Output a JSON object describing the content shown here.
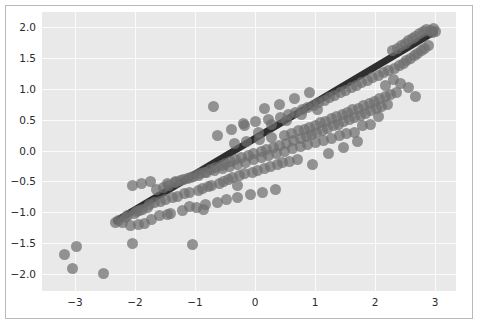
{
  "chart_data": {
    "type": "scatter",
    "title": "",
    "subtitle": "",
    "xlabel": "",
    "ylabel": "",
    "xlim": [
      -3.55,
      3.35
    ],
    "ylim": [
      -2.28,
      2.25
    ],
    "xticks": [
      -3,
      -2,
      -1,
      0,
      1,
      2,
      3
    ],
    "xticklabels": [
      "−3",
      "−2",
      "−1",
      "0",
      "1",
      "2",
      "3"
    ],
    "yticks": [
      -2.0,
      -1.5,
      -1.0,
      -0.5,
      0.0,
      0.5,
      1.0,
      1.5,
      2.0
    ],
    "yticklabels": [
      "−2.0",
      "−1.5",
      "−1.0",
      "−0.5",
      "0.0",
      "0.5",
      "1.0",
      "1.5",
      "2.0"
    ],
    "grid": true,
    "grid_color": "#fbfbfb",
    "plot_background": "#e9e9e9",
    "figure_background": "#ffffff",
    "legend": null,
    "marker": {
      "shape": "circle",
      "size_px": 11,
      "color": "#6f6f6f",
      "alpha": 0.72
    },
    "series": [
      {
        "name": "observations",
        "type": "scatter",
        "points": [
          [
            -3.18,
            -1.68
          ],
          [
            -3.05,
            -1.92
          ],
          [
            -2.97,
            -1.55
          ],
          [
            -2.52,
            -1.99
          ],
          [
            -2.33,
            -1.16
          ],
          [
            -2.27,
            -1.13
          ],
          [
            -2.21,
            -1.16
          ],
          [
            -2.16,
            -1.09
          ],
          [
            -2.12,
            -1.05
          ],
          [
            -2.08,
            -1.21
          ],
          [
            -2.04,
            -1.51
          ],
          [
            -2.01,
            -1.02
          ],
          [
            -1.98,
            -0.99
          ],
          [
            -1.95,
            -1.2
          ],
          [
            -1.92,
            -0.97
          ],
          [
            -1.88,
            -0.95
          ],
          [
            -1.84,
            -1.18
          ],
          [
            -1.8,
            -0.92
          ],
          [
            -1.76,
            -0.88
          ],
          [
            -1.72,
            -1.12
          ],
          [
            -1.68,
            -0.85
          ],
          [
            -1.64,
            -0.63
          ],
          [
            -1.6,
            -1.06
          ],
          [
            -1.57,
            -0.82
          ],
          [
            -1.53,
            -0.6
          ],
          [
            -1.49,
            -0.79
          ],
          [
            -1.45,
            -0.56
          ],
          [
            -1.41,
            -1.02
          ],
          [
            -1.37,
            -0.76
          ],
          [
            -1.33,
            -0.52
          ],
          [
            -1.29,
            -0.74
          ],
          [
            -1.25,
            -0.49
          ],
          [
            -1.21,
            -0.97
          ],
          [
            -1.17,
            -0.7
          ],
          [
            -1.13,
            -0.45
          ],
          [
            -1.09,
            -0.68
          ],
          [
            -1.05,
            -1.52
          ],
          [
            -1.02,
            -0.42
          ],
          [
            -0.98,
            -0.92
          ],
          [
            -0.95,
            -0.65
          ],
          [
            -0.92,
            -0.38
          ],
          [
            -0.88,
            -0.62
          ],
          [
            -0.85,
            -0.35
          ],
          [
            -0.82,
            -0.88
          ],
          [
            -0.78,
            -0.59
          ],
          [
            -0.75,
            -0.31
          ],
          [
            -0.72,
            -0.56
          ],
          [
            -0.69,
            0.72
          ],
          [
            -0.66,
            -0.28
          ],
          [
            -0.62,
            -0.84
          ],
          [
            -0.59,
            -0.53
          ],
          [
            -0.56,
            -0.24
          ],
          [
            -0.53,
            -0.5
          ],
          [
            -0.5,
            -0.21
          ],
          [
            -0.47,
            -0.8
          ],
          [
            -0.44,
            -0.47
          ],
          [
            -0.41,
            -0.18
          ],
          [
            -0.38,
            -0.44
          ],
          [
            -0.35,
            0.12
          ],
          [
            -0.32,
            -0.14
          ],
          [
            -0.29,
            -0.76
          ],
          [
            -0.26,
            -0.41
          ],
          [
            -0.23,
            -0.11
          ],
          [
            -0.2,
            0.44
          ],
          [
            -0.17,
            -0.38
          ],
          [
            -0.14,
            0.15
          ],
          [
            -0.11,
            -0.08
          ],
          [
            -0.08,
            -0.72
          ],
          [
            -0.05,
            -0.35
          ],
          [
            -0.02,
            -0.04
          ],
          [
            0.01,
            0.47
          ],
          [
            0.04,
            -0.32
          ],
          [
            0.07,
            0.18
          ],
          [
            0.1,
            -0.01
          ],
          [
            0.13,
            -0.68
          ],
          [
            0.16,
            -0.29
          ],
          [
            0.19,
            0.02
          ],
          [
            0.22,
            0.5
          ],
          [
            0.25,
            -0.26
          ],
          [
            0.28,
            0.21
          ],
          [
            0.31,
            0.05
          ],
          [
            0.34,
            -0.64
          ],
          [
            0.37,
            -0.23
          ],
          [
            0.4,
            0.09
          ],
          [
            0.43,
            0.54
          ],
          [
            0.46,
            -0.2
          ],
          [
            0.49,
            0.25
          ],
          [
            0.52,
            0.12
          ],
          [
            0.55,
            0.58
          ],
          [
            0.58,
            -0.17
          ],
          [
            0.61,
            0.28
          ],
          [
            0.64,
            0.16
          ],
          [
            0.67,
            0.62
          ],
          [
            0.7,
            -0.14
          ],
          [
            0.73,
            0.32
          ],
          [
            0.76,
            0.19
          ],
          [
            0.79,
            0.66
          ],
          [
            0.82,
            0.35
          ],
          [
            0.85,
            0.23
          ],
          [
            0.88,
            0.7
          ],
          [
            0.91,
            0.38
          ],
          [
            0.94,
            0.26
          ],
          [
            0.97,
            0.74
          ],
          [
            1.0,
            0.41
          ],
          [
            1.03,
            0.29
          ],
          [
            1.06,
            0.78
          ],
          [
            1.09,
            0.45
          ],
          [
            1.12,
            0.33
          ],
          [
            1.15,
            0.82
          ],
          [
            1.18,
            0.48
          ],
          [
            1.21,
            0.36
          ],
          [
            1.24,
            0.86
          ],
          [
            1.27,
            0.52
          ],
          [
            1.3,
            0.4
          ],
          [
            1.33,
            0.9
          ],
          [
            1.36,
            0.55
          ],
          [
            1.39,
            0.43
          ],
          [
            1.42,
            0.94
          ],
          [
            1.45,
            0.59
          ],
          [
            1.48,
            0.47
          ],
          [
            1.51,
            0.98
          ],
          [
            1.54,
            0.62
          ],
          [
            1.57,
            0.5
          ],
          [
            1.6,
            1.02
          ],
          [
            1.63,
            0.66
          ],
          [
            1.66,
            0.54
          ],
          [
            1.69,
            1.06
          ],
          [
            1.72,
            0.69
          ],
          [
            1.75,
            0.57
          ],
          [
            1.78,
            1.1
          ],
          [
            1.81,
            0.73
          ],
          [
            1.84,
            0.61
          ],
          [
            1.87,
            1.14
          ],
          [
            1.9,
            0.77
          ],
          [
            1.93,
            0.65
          ],
          [
            1.96,
            1.18
          ],
          [
            1.99,
            0.8
          ],
          [
            2.02,
            0.68
          ],
          [
            2.05,
            1.22
          ],
          [
            2.08,
            0.84
          ],
          [
            2.11,
            0.72
          ],
          [
            2.14,
            1.26
          ],
          [
            2.17,
            0.87
          ],
          [
            2.2,
            0.75
          ],
          [
            2.23,
            1.3
          ],
          [
            2.26,
            0.91
          ],
          [
            2.29,
            1.62
          ],
          [
            2.32,
            1.34
          ],
          [
            2.35,
            0.95
          ],
          [
            2.38,
            1.66
          ],
          [
            2.41,
            1.38
          ],
          [
            2.44,
            1.7
          ],
          [
            2.47,
            1.42
          ],
          [
            2.5,
            1.74
          ],
          [
            2.53,
            1.46
          ],
          [
            2.56,
            1.78
          ],
          [
            2.59,
            1.5
          ],
          [
            2.62,
            1.82
          ],
          [
            2.65,
            1.54
          ],
          [
            2.68,
            1.86
          ],
          [
            2.71,
            1.58
          ],
          [
            2.74,
            1.9
          ],
          [
            2.77,
            1.62
          ],
          [
            2.8,
            1.94
          ],
          [
            2.83,
            1.66
          ],
          [
            2.86,
            1.97
          ],
          [
            2.89,
            1.7
          ],
          [
            2.92,
            1.95
          ],
          [
            2.95,
            1.92
          ],
          [
            2.98,
            1.98
          ],
          [
            3.01,
            1.93
          ],
          [
            2.67,
            0.88
          ],
          [
            2.55,
            1.02
          ],
          [
            2.43,
            1.09
          ],
          [
            2.3,
            1.16
          ],
          [
            2.18,
            1.05
          ],
          [
            2.05,
            0.55
          ],
          [
            1.92,
            0.42
          ],
          [
            1.79,
            0.4
          ],
          [
            1.66,
            0.3
          ],
          [
            1.53,
            0.27
          ],
          [
            1.4,
            0.24
          ],
          [
            1.27,
            0.2
          ],
          [
            1.14,
            0.17
          ],
          [
            1.01,
            0.13
          ],
          [
            0.88,
            0.1
          ],
          [
            0.75,
            0.06
          ],
          [
            0.62,
            0.03
          ],
          [
            0.49,
            -0.01
          ],
          [
            0.36,
            -0.05
          ],
          [
            0.23,
            -0.08
          ],
          [
            0.1,
            -0.12
          ],
          [
            -0.03,
            -0.15
          ],
          [
            -0.16,
            -0.19
          ],
          [
            -0.29,
            -0.22
          ],
          [
            -0.42,
            -0.26
          ],
          [
            -0.55,
            -0.29
          ],
          [
            -0.68,
            -0.33
          ],
          [
            -0.81,
            -0.36
          ],
          [
            -0.94,
            -0.4
          ],
          [
            -1.07,
            -0.43
          ],
          [
            -1.2,
            -0.47
          ],
          [
            -1.33,
            -0.5
          ],
          [
            -1.46,
            -0.54
          ],
          [
            -0.63,
            0.25
          ],
          [
            -0.4,
            0.34
          ],
          [
            -0.18,
            0.41
          ],
          [
            0.05,
            0.3
          ],
          [
            0.28,
            0.43
          ],
          [
            0.52,
            0.49
          ],
          [
            0.77,
            0.58
          ],
          [
            1.04,
            0.67
          ],
          [
            0.15,
            0.68
          ],
          [
            0.4,
            0.75
          ],
          [
            0.65,
            0.84
          ],
          [
            0.9,
            0.95
          ],
          [
            -1.1,
            -0.9
          ],
          [
            -1.46,
            -1.04
          ],
          [
            -0.86,
            -0.95
          ],
          [
            -0.3,
            -0.56
          ],
          [
            1.22,
            -0.05
          ],
          [
            0.95,
            -0.22
          ],
          [
            1.48,
            0.05
          ],
          [
            1.7,
            0.15
          ],
          [
            -2.05,
            -0.57
          ],
          [
            -1.9,
            -0.54
          ],
          [
            -1.75,
            -0.51
          ]
        ]
      },
      {
        "name": "regression-line",
        "type": "line",
        "color": "#2e2e2e",
        "width_px": 7,
        "x0": -2.31,
        "y0": -1.14,
        "x1": 2.99,
        "y1": 1.93
      }
    ]
  },
  "axes": {
    "x_tick_labels": [
      "−3",
      "−2",
      "−1",
      "0",
      "1",
      "2",
      "3"
    ],
    "y_tick_labels": [
      "2.0",
      "1.5",
      "1.0",
      "0.5",
      "0.0",
      "−0.5",
      "−1.0",
      "−1.5",
      "−2.0"
    ]
  }
}
